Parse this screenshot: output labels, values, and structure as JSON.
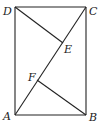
{
  "diagram": {
    "type": "rectangle-with-diagonal-and-perpendiculars",
    "points": {
      "A": {
        "label": "A",
        "x": 15,
        "y": 115
      },
      "B": {
        "label": "B",
        "x": 86,
        "y": 115
      },
      "C": {
        "label": "C",
        "x": 86,
        "y": 7
      },
      "D": {
        "label": "D",
        "x": 15,
        "y": 7
      },
      "E": {
        "label": "E",
        "x": 63,
        "y": 43
      },
      "F": {
        "label": "F",
        "x": 37,
        "y": 80
      }
    },
    "segments": [
      "AB",
      "BC",
      "CD",
      "DA",
      "AC",
      "DE",
      "BF"
    ]
  }
}
